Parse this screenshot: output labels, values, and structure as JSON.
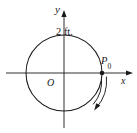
{
  "figure": {
    "kind": "coordinate-plane-circle-diagram",
    "background_color": "#ffffff",
    "stroke_color": "#1a1a1a",
    "labels": {
      "y_axis": "y",
      "x_axis": "x",
      "origin": "O",
      "radius": "2 ft.",
      "point_base": "P",
      "point_subscript": "0",
      "point_full": "P0"
    }
  },
  "geometry": {
    "origin_px": {
      "x": 64,
      "y": 73
    },
    "circle_radius_px": 38,
    "point_P0_px": {
      "x": 102,
      "y": 73
    },
    "x_axis": {
      "x1": 6,
      "x2": 133,
      "y": 73
    },
    "y_axis": {
      "x": 64,
      "y1": 10,
      "y2": 128
    },
    "rotation_direction": "clockwise",
    "radius_value": 2,
    "radius_units": "ft."
  }
}
